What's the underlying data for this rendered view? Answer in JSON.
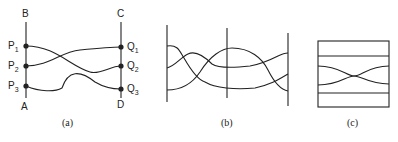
{
  "figure": {
    "panels": [
      {
        "id": "a",
        "caption": "(a)",
        "endpoints": {
          "top_left": "B",
          "top_right": "C",
          "bottom_left": "A",
          "bottom_right": "D"
        },
        "left_points": [
          {
            "letter": "P",
            "index": "1"
          },
          {
            "letter": "P",
            "index": "2"
          },
          {
            "letter": "P",
            "index": "3"
          }
        ],
        "right_points": [
          {
            "letter": "Q",
            "index": "1"
          },
          {
            "letter": "Q",
            "index": "2"
          },
          {
            "letter": "Q",
            "index": "3"
          }
        ]
      },
      {
        "id": "b",
        "caption": "(b)"
      },
      {
        "id": "c",
        "caption": "(c)"
      }
    ]
  },
  "colors": {
    "stroke": "#222222",
    "background": "#ffffff"
  }
}
